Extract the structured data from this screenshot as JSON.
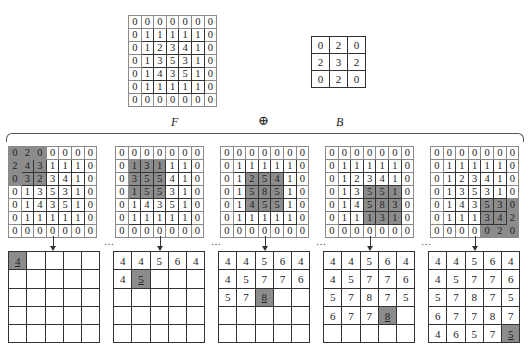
{
  "labels": {
    "F": "F",
    "B": "B",
    "operator": "⊕",
    "ellipsis": "…"
  },
  "F": [
    [
      0,
      0,
      0,
      0,
      0,
      0,
      0
    ],
    [
      0,
      1,
      1,
      1,
      1,
      1,
      0
    ],
    [
      0,
      1,
      2,
      3,
      4,
      1,
      0
    ],
    [
      0,
      1,
      3,
      5,
      3,
      1,
      0
    ],
    [
      0,
      1,
      4,
      3,
      5,
      1,
      0
    ],
    [
      0,
      1,
      1,
      1,
      1,
      1,
      0
    ],
    [
      0,
      0,
      0,
      0,
      0,
      0,
      0
    ]
  ],
  "B": [
    [
      0,
      2,
      0
    ],
    [
      2,
      3,
      2
    ],
    [
      0,
      2,
      0
    ]
  ],
  "steps": [
    {
      "highlight": {
        "row": 0,
        "col": 0
      },
      "input": [
        [
          0,
          2,
          0,
          0,
          0,
          0,
          0
        ],
        [
          2,
          4,
          3,
          1,
          1,
          1,
          0
        ],
        [
          0,
          3,
          2,
          3,
          4,
          1,
          0
        ],
        [
          0,
          1,
          3,
          5,
          3,
          1,
          0
        ],
        [
          0,
          1,
          4,
          3,
          5,
          1,
          0
        ],
        [
          0,
          1,
          1,
          1,
          1,
          1,
          0
        ],
        [
          0,
          0,
          0,
          0,
          0,
          0,
          0
        ]
      ],
      "output": [
        [
          "4",
          "",
          "",
          "",
          ""
        ],
        [
          "",
          "",
          "",
          "",
          ""
        ],
        [
          "",
          "",
          "",
          "",
          ""
        ],
        [
          "",
          "",
          "",
          "",
          ""
        ],
        [
          "",
          "",
          "",
          "",
          ""
        ]
      ],
      "output_highlight": {
        "row": 0,
        "col": 0
      }
    },
    {
      "highlight": {
        "row": 1,
        "col": 1
      },
      "input": [
        [
          0,
          0,
          0,
          0,
          0,
          0,
          0
        ],
        [
          0,
          1,
          3,
          1,
          1,
          1,
          0
        ],
        [
          0,
          3,
          5,
          5,
          4,
          1,
          0
        ],
        [
          0,
          1,
          5,
          5,
          3,
          1,
          0
        ],
        [
          0,
          1,
          4,
          3,
          5,
          1,
          0
        ],
        [
          0,
          1,
          1,
          1,
          1,
          1,
          0
        ],
        [
          0,
          0,
          0,
          0,
          0,
          0,
          0
        ]
      ],
      "output": [
        [
          "4",
          "4",
          "5",
          "6",
          "4"
        ],
        [
          "4",
          "5",
          "",
          "",
          ""
        ],
        [
          "",
          "",
          "",
          "",
          ""
        ],
        [
          "",
          "",
          "",
          "",
          ""
        ],
        [
          "",
          "",
          "",
          "",
          ""
        ]
      ],
      "output_highlight": {
        "row": 1,
        "col": 1
      }
    },
    {
      "highlight": {
        "row": 2,
        "col": 2
      },
      "input": [
        [
          0,
          0,
          0,
          0,
          0,
          0,
          0
        ],
        [
          0,
          1,
          1,
          1,
          1,
          1,
          0
        ],
        [
          0,
          1,
          2,
          5,
          4,
          1,
          0
        ],
        [
          0,
          1,
          5,
          8,
          5,
          1,
          0
        ],
        [
          0,
          1,
          4,
          5,
          5,
          1,
          0
        ],
        [
          0,
          1,
          1,
          1,
          1,
          1,
          0
        ],
        [
          0,
          0,
          0,
          0,
          0,
          0,
          0
        ]
      ],
      "output": [
        [
          "4",
          "4",
          "5",
          "6",
          "4"
        ],
        [
          "4",
          "5",
          "7",
          "7",
          "6"
        ],
        [
          "5",
          "7",
          "8",
          "",
          ""
        ],
        [
          "",
          "",
          "",
          "",
          ""
        ],
        [
          "",
          "",
          "",
          "",
          ""
        ]
      ],
      "output_highlight": {
        "row": 2,
        "col": 2
      }
    },
    {
      "highlight": {
        "row": 3,
        "col": 3
      },
      "input": [
        [
          0,
          0,
          0,
          0,
          0,
          0,
          0
        ],
        [
          0,
          1,
          1,
          1,
          1,
          1,
          0
        ],
        [
          0,
          1,
          2,
          3,
          4,
          1,
          0
        ],
        [
          0,
          1,
          3,
          5,
          5,
          1,
          0
        ],
        [
          0,
          1,
          4,
          5,
          8,
          3,
          0
        ],
        [
          0,
          1,
          1,
          1,
          3,
          1,
          0
        ],
        [
          0,
          0,
          0,
          0,
          0,
          0,
          0
        ]
      ],
      "output": [
        [
          "4",
          "4",
          "5",
          "6",
          "4"
        ],
        [
          "4",
          "5",
          "7",
          "7",
          "6"
        ],
        [
          "5",
          "7",
          "8",
          "7",
          "5"
        ],
        [
          "6",
          "7",
          "7",
          "8",
          ""
        ],
        [
          "",
          "",
          "",
          "",
          ""
        ]
      ],
      "output_highlight": {
        "row": 3,
        "col": 3
      }
    },
    {
      "highlight": {
        "row": 4,
        "col": 4
      },
      "input": [
        [
          0,
          0,
          0,
          0,
          0,
          0,
          0
        ],
        [
          0,
          1,
          1,
          1,
          1,
          1,
          0
        ],
        [
          0,
          1,
          2,
          3,
          4,
          1,
          0
        ],
        [
          0,
          1,
          3,
          5,
          3,
          1,
          0
        ],
        [
          0,
          1,
          4,
          3,
          5,
          3,
          0
        ],
        [
          0,
          1,
          1,
          1,
          3,
          4,
          2
        ],
        [
          0,
          0,
          0,
          0,
          0,
          2,
          0
        ]
      ],
      "output": [
        [
          "4",
          "4",
          "5",
          "6",
          "4"
        ],
        [
          "4",
          "5",
          "7",
          "7",
          "6"
        ],
        [
          "5",
          "7",
          "8",
          "7",
          "5"
        ],
        [
          "6",
          "7",
          "7",
          "8",
          "7"
        ],
        [
          "4",
          "6",
          "5",
          "7",
          "5"
        ]
      ],
      "output_highlight": {
        "row": 4,
        "col": 4
      }
    }
  ],
  "layout": {
    "input_x": [
      8,
      115,
      220,
      325,
      430
    ],
    "output_x": [
      8,
      113,
      218,
      323,
      428
    ]
  }
}
